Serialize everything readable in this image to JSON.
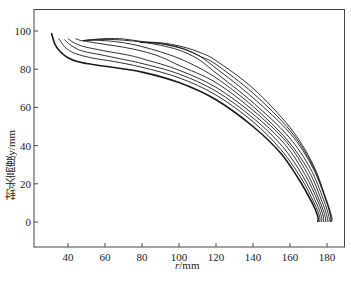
{
  "chart_data": {
    "type": "line",
    "title": "",
    "xlabel": "r/mm",
    "ylabel": "封头高度y/mm",
    "xlim": [
      22,
      186
    ],
    "ylim": [
      -12,
      112
    ],
    "xticks": [
      40,
      60,
      80,
      100,
      120,
      140,
      160,
      180
    ],
    "yticks": [
      0,
      20,
      40,
      60,
      80,
      100
    ],
    "grid": false,
    "legend": null,
    "series": [
      {
        "name": "curve-1",
        "x": [
          31,
          33,
          36,
          40,
          45,
          50,
          60,
          80,
          100,
          120,
          140,
          155,
          165,
          172,
          175,
          175
        ],
        "y": [
          99,
          93,
          89,
          86,
          84,
          83,
          81.5,
          78.5,
          73,
          64,
          50,
          36,
          22,
          10,
          3,
          0
        ]
      },
      {
        "name": "curve-2",
        "x": [
          35,
          38,
          42,
          48,
          55,
          65,
          80,
          100,
          120,
          140,
          155,
          166,
          173,
          176,
          176
        ],
        "y": [
          96,
          92,
          89,
          87,
          85.5,
          84,
          81,
          75.5,
          66.5,
          52.5,
          38,
          23,
          10,
          3,
          0
        ]
      },
      {
        "name": "curve-3",
        "x": [
          38,
          41,
          45,
          50,
          58,
          68,
          80,
          100,
          120,
          140,
          156,
          167,
          174,
          177,
          177
        ],
        "y": [
          95.5,
          93,
          90.5,
          89,
          87.5,
          85.5,
          83,
          77.5,
          68.5,
          54.5,
          39.5,
          24,
          10.5,
          3,
          0
        ]
      },
      {
        "name": "curve-4",
        "x": [
          40,
          43,
          48,
          55,
          63,
          72,
          82,
          100,
          120,
          140,
          157,
          168,
          175,
          178,
          178
        ],
        "y": [
          96,
          94,
          92,
          90.5,
          89,
          87.5,
          85,
          79.5,
          70.5,
          56.5,
          41,
          25,
          11,
          3,
          0
        ]
      },
      {
        "name": "curve-5",
        "x": [
          44,
          47,
          50,
          60,
          70,
          80,
          90,
          100,
          120,
          140,
          158,
          169,
          176,
          179,
          179
        ],
        "y": [
          96,
          95,
          94.5,
          93,
          91.5,
          89.5,
          86.5,
          82,
          73,
          58.5,
          42,
          26,
          11,
          3,
          0
        ]
      },
      {
        "name": "curve-6",
        "x": [
          48,
          55,
          65,
          75,
          85,
          95,
          105,
          120,
          140,
          158,
          170,
          177,
          180,
          180
        ],
        "y": [
          95,
          95.2,
          94.5,
          93,
          90.5,
          87.5,
          83.5,
          75.5,
          60.5,
          43.5,
          27,
          11.5,
          3,
          0
        ]
      },
      {
        "name": "curve-7",
        "x": [
          48,
          60,
          70,
          80,
          90,
          100,
          110,
          120,
          140,
          159,
          171,
          178,
          181,
          181
        ],
        "y": [
          95,
          95.6,
          95.2,
          94.2,
          92.5,
          90,
          85.5,
          78,
          62.5,
          45,
          28,
          12,
          3,
          0
        ]
      },
      {
        "name": "curve-8",
        "x": [
          48,
          60,
          70,
          80,
          90,
          100,
          110,
          120,
          140,
          160,
          172,
          179,
          182,
          182
        ],
        "y": [
          95,
          96,
          95.8,
          94.5,
          93.5,
          91.5,
          87.5,
          80.5,
          65,
          46.5,
          29,
          12.5,
          3,
          0
        ]
      },
      {
        "name": "curve-9",
        "x": [
          79,
          88,
          96,
          104,
          112,
          120,
          140,
          160,
          172,
          179,
          182,
          182
        ],
        "y": [
          94,
          93.6,
          92.2,
          90,
          86.5,
          82.5,
          67.5,
          48,
          30,
          13,
          3,
          0
        ]
      },
      {
        "name": "curve-10",
        "x": [
          79,
          88,
          96,
          104,
          112,
          120,
          140,
          160,
          172,
          179,
          182.5,
          182.5
        ],
        "y": [
          94,
          94,
          93,
          91.2,
          88.5,
          84.5,
          70,
          49.5,
          31,
          13.5,
          3,
          0
        ]
      }
    ],
    "line_color": "#1a1a1a"
  },
  "axes": {
    "xlabel_var": "r",
    "xlabel_unit": "/mm",
    "ylabel": "封头高度y/mm"
  }
}
